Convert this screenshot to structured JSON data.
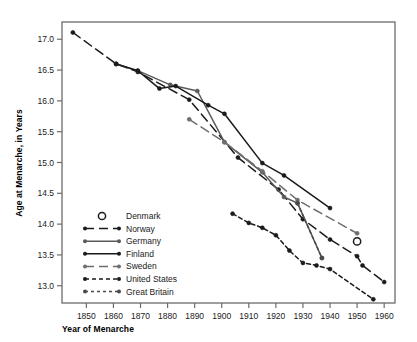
{
  "chart_data": {
    "type": "line",
    "title": "",
    "xlabel": "Year of Menarche",
    "ylabel": "Age at Menarche, in Years",
    "xlim": [
      1841,
      1964
    ],
    "ylim": [
      12.72,
      17.28
    ],
    "xticks": [
      1850,
      1860,
      1870,
      1880,
      1890,
      1900,
      1910,
      1920,
      1930,
      1940,
      1950,
      1960
    ],
    "xtick_labels": [
      "1850",
      "1860",
      "1870",
      "1880",
      "1890",
      "1900",
      "1910",
      "1920",
      "1930",
      "1940",
      "1950",
      "1960"
    ],
    "yticks": [
      13.0,
      13.5,
      14.0,
      14.5,
      15.0,
      15.5,
      16.0,
      16.5,
      17.0
    ],
    "ytick_labels": [
      "13.0",
      "13.5",
      "14.0",
      "14.5",
      "15.0",
      "15.5",
      "16.0",
      "16.5",
      "17.0"
    ],
    "grid": false,
    "legend_position": "lower-left-inside",
    "frame": true,
    "series": [
      {
        "name": "Denmark",
        "color": "#1a1a1a",
        "style": "marker-only",
        "marker": "open-circle",
        "legend_key": "open-circle",
        "points": [
          [
            1950,
            13.72
          ]
        ]
      },
      {
        "name": "Norway",
        "color": "#1a1a1a",
        "style": "long-dash",
        "marker": "filled-circle",
        "legend_key": "dash-long",
        "points": [
          [
            1845,
            17.11
          ],
          [
            1861,
            16.6
          ],
          [
            1869,
            16.47
          ],
          [
            1888,
            16.02
          ],
          [
            1906,
            15.08
          ],
          [
            1921,
            14.56
          ],
          [
            1930,
            14.08
          ],
          [
            1940,
            13.75
          ],
          [
            1950,
            13.48
          ],
          [
            1952,
            13.33
          ],
          [
            1960,
            13.06
          ]
        ]
      },
      {
        "name": "Germany",
        "color": "#5a5a5a",
        "style": "solid",
        "marker": "filled-circle",
        "legend_key": "solid-gray",
        "points": [
          [
            1861,
            16.6
          ],
          [
            1869,
            16.49
          ],
          [
            1881,
            16.26
          ],
          [
            1891,
            16.16
          ],
          [
            1901,
            15.33
          ],
          [
            1915,
            14.84
          ],
          [
            1923,
            14.44
          ],
          [
            1928,
            14.34
          ],
          [
            1937,
            13.45
          ]
        ]
      },
      {
        "name": "Finland",
        "color": "#1a1a1a",
        "style": "solid",
        "marker": "filled-circle",
        "legend_key": "solid-black",
        "points": [
          [
            1861,
            16.6
          ],
          [
            1869,
            16.49
          ],
          [
            1877,
            16.2
          ],
          [
            1883,
            16.24
          ],
          [
            1895,
            15.93
          ],
          [
            1901,
            15.79
          ],
          [
            1915,
            14.99
          ],
          [
            1923,
            14.79
          ],
          [
            1940,
            14.26
          ]
        ]
      },
      {
        "name": "Sweden",
        "color": "#6e6e6e",
        "style": "long-dash",
        "marker": "filled-circle",
        "legend_key": "dash-gray",
        "points": [
          [
            1888,
            15.7
          ],
          [
            1901,
            15.33
          ],
          [
            1915,
            14.86
          ],
          [
            1928,
            14.39
          ],
          [
            1950,
            13.85
          ]
        ]
      },
      {
        "name": "United States",
        "color": "#1a1a1a",
        "style": "short-dash",
        "marker": "filled-circle",
        "legend_key": "dash-short-black",
        "points": [
          [
            1904,
            14.17
          ],
          [
            1910,
            14.02
          ],
          [
            1915,
            13.94
          ],
          [
            1920,
            13.82
          ],
          [
            1925,
            13.57
          ],
          [
            1930,
            13.37
          ],
          [
            1935,
            13.33
          ],
          [
            1940,
            13.27
          ],
          [
            1956,
            12.78
          ]
        ]
      },
      {
        "name": "Great Britain",
        "color": "#4a4a4a",
        "style": "dotted-dash",
        "marker": "filled-circle",
        "legend_key": "dash-dot-gray",
        "points": [
          [
            1928,
            14.34
          ],
          [
            1937,
            13.45
          ]
        ]
      }
    ],
    "legend_entries": [
      {
        "label": "Denmark",
        "key": "open-circle"
      },
      {
        "label": "Norway",
        "key": "dash-long"
      },
      {
        "label": "Germany",
        "key": "solid-gray"
      },
      {
        "label": "Finland",
        "key": "solid-black"
      },
      {
        "label": "Sweden",
        "key": "dash-gray"
      },
      {
        "label": "United States",
        "key": "dash-short-black"
      },
      {
        "label": "Great Britain",
        "key": "dash-dot-gray"
      }
    ]
  },
  "axes": {
    "xlabel": "Year of Menarche",
    "ylabel": "Age at Menarche, in Years"
  },
  "colors": {
    "black": "#1a1a1a",
    "gray": "#5a5a5a",
    "frame": "#6b6b6b",
    "background": "#ffffff"
  }
}
